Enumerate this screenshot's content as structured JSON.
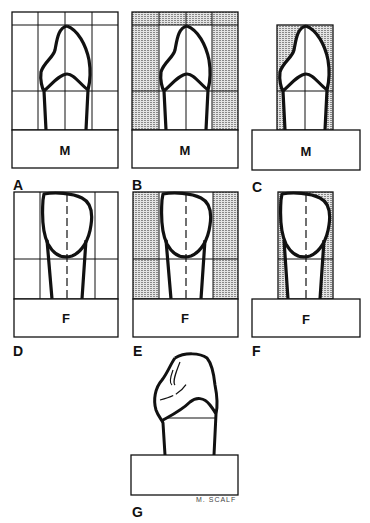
{
  "figure": {
    "panels": [
      {
        "id": "A",
        "label": "A",
        "base_label": "M",
        "view": "mesial",
        "style": "grid"
      },
      {
        "id": "B",
        "label": "B",
        "base_label": "M",
        "view": "mesial",
        "style": "grid-shaded-sides"
      },
      {
        "id": "C",
        "label": "C",
        "base_label": "M",
        "view": "mesial",
        "style": "cropped-shaded"
      },
      {
        "id": "D",
        "label": "D",
        "base_label": "F",
        "view": "facial",
        "style": "grid"
      },
      {
        "id": "E",
        "label": "E",
        "base_label": "F",
        "view": "facial",
        "style": "grid-shaded-sides"
      },
      {
        "id": "F",
        "label": "F",
        "base_label": "F",
        "view": "facial",
        "style": "cropped-shaded"
      },
      {
        "id": "G",
        "label": "G",
        "base_label": "",
        "view": "oblique",
        "style": "finished"
      }
    ],
    "signature": "M. SCALF",
    "colors": {
      "line": "#111111",
      "shade": "#bdbdbd",
      "background": "#ffffff"
    }
  }
}
